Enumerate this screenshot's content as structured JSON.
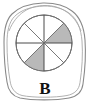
{
  "figure": {
    "label": "B",
    "label_position": "bottom-center",
    "outline_shape": "hand-drawn-irregular-blob",
    "colors": {
      "background": "#ffffff",
      "blob_stroke": "#8a8a8a",
      "blob_inner_stroke": "#a8a8a8",
      "circle_stroke": "#6f6f6f",
      "spoke_stroke": "#4a4a4a",
      "shaded_sector_fill": "#b9b9b9",
      "label_color": "#111111"
    }
  },
  "chart_data": {
    "type": "pie",
    "title": "B",
    "xlabel": "",
    "ylabel": "",
    "legend": [],
    "grid": false,
    "sector_count": 8,
    "equal_sectors": true,
    "sector_angle_degrees": 45,
    "shaded_count": 2,
    "unshaded_count": 6,
    "fraction_shaded": "2/8",
    "categories": [
      "sector-1",
      "sector-2",
      "sector-3",
      "sector-4",
      "sector-5",
      "sector-6",
      "sector-7",
      "sector-8"
    ],
    "values": [
      12.5,
      12.5,
      12.5,
      12.5,
      12.5,
      12.5,
      12.5,
      12.5
    ],
    "sectors": [
      {
        "name": "sector-1",
        "start_deg": 0,
        "end_deg": 45,
        "shaded": true,
        "fill": "#b9b9b9"
      },
      {
        "name": "sector-2",
        "start_deg": 45,
        "end_deg": 90,
        "shaded": false,
        "fill": "#ffffff"
      },
      {
        "name": "sector-3",
        "start_deg": 90,
        "end_deg": 135,
        "shaded": false,
        "fill": "#ffffff"
      },
      {
        "name": "sector-4",
        "start_deg": 135,
        "end_deg": 180,
        "shaded": false,
        "fill": "#ffffff"
      },
      {
        "name": "sector-5",
        "start_deg": 180,
        "end_deg": 225,
        "shaded": false,
        "fill": "#ffffff"
      },
      {
        "name": "sector-6",
        "start_deg": 225,
        "end_deg": 270,
        "shaded": true,
        "fill": "#b9b9b9"
      },
      {
        "name": "sector-7",
        "start_deg": 270,
        "end_deg": 315,
        "shaded": false,
        "fill": "#ffffff"
      },
      {
        "name": "sector-8",
        "start_deg": 315,
        "end_deg": 360,
        "shaded": false,
        "fill": "#ffffff"
      }
    ]
  }
}
